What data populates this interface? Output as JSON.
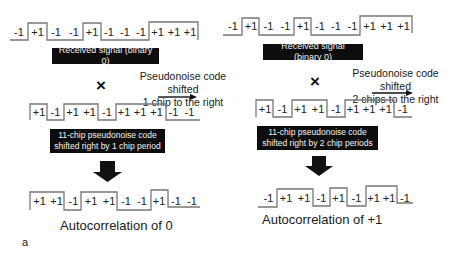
{
  "left_panel": {
    "received_signal": {
      "chips": [
        "-1",
        "+1",
        "-1",
        "-1",
        "+1",
        "-1",
        "-1",
        "-1",
        "+1",
        "+1",
        "+1"
      ],
      "label": "Received signal (binary 0)"
    },
    "operator": "×",
    "shift_note": {
      "line1": "Pseudonoise code shifted",
      "line2": "1 chip to the right"
    },
    "pn_code": {
      "chips": [
        "+1",
        "-1",
        "+1",
        "+1",
        "-1",
        "+1",
        "+1",
        "+1",
        "-1",
        "-1"
      ],
      "label_line1": "11-chip pseudonoise code",
      "label_line2": "shifted right by 1 chip period"
    },
    "result": {
      "chips": [
        "+1",
        "+1",
        "-1",
        "+1",
        "+1",
        "-1",
        "-1",
        "+1",
        "-1",
        "-1"
      ],
      "label": "Autocorrelation of 0"
    }
  },
  "right_panel": {
    "received_signal": {
      "chips": [
        "-1",
        "+1",
        "-1",
        "-1",
        "+1",
        "-1",
        "-1",
        "-1",
        "+1",
        "+1",
        "+1"
      ],
      "label": "Received signal (binary 0)"
    },
    "operator": "×",
    "shift_note": {
      "line1": "Pseudonoise code shifted",
      "line2": "2 chips to the right"
    },
    "pn_code": {
      "chips": [
        "+1",
        "-1",
        "+1",
        "+1",
        "-1",
        "+1",
        "+1",
        "+1",
        "-1"
      ],
      "label_line1": "11-chip pseudonoise code",
      "label_line2": "shifted right by 2 chip periods"
    },
    "result": {
      "chips": [
        "-1",
        "+1",
        "+1",
        "-1",
        "+1",
        "-1",
        "+1",
        "+1",
        "-1"
      ],
      "label": "Autocorrelation of +1"
    }
  },
  "panel_letter": "a"
}
